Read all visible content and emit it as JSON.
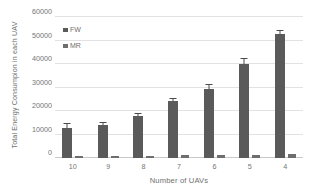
{
  "chart_data": {
    "type": "bar",
    "title": "",
    "xlabel": "Number of UAVs",
    "ylabel": "Total Energy Consumpion in each UAV",
    "categories": [
      "10",
      "9",
      "8",
      "7",
      "6",
      "5",
      "4"
    ],
    "ylim": [
      0,
      60000
    ],
    "yticks": [
      0,
      10000,
      20000,
      30000,
      40000,
      50000,
      60000
    ],
    "ytick_labels": [
      "0",
      "10000",
      "20000",
      "30000",
      "40000",
      "50000",
      "60000"
    ],
    "grid": true,
    "legend_position": "inside-top-left",
    "series": [
      {
        "name": "FW",
        "color": "#5a5a5a",
        "values": [
          12800,
          14200,
          18000,
          24200,
          29400,
          40100,
          52800
        ],
        "errors": [
          1500,
          700,
          900,
          900,
          1700,
          1900,
          1400
        ]
      },
      {
        "name": "MR",
        "color": "#6e6e6e",
        "values": [
          700,
          800,
          950,
          1100,
          1300,
          1400,
          1800
        ],
        "errors": [
          0,
          0,
          0,
          0,
          0,
          0,
          0
        ]
      }
    ]
  },
  "legend": {
    "items": [
      {
        "label": "FW",
        "color": "#5a5a5a"
      },
      {
        "label": "MR",
        "color": "#6e6e6e"
      }
    ]
  },
  "axes": {
    "x_title": "Number of UAVs",
    "y_title": "Total Energy Consumpion in each UAV"
  }
}
